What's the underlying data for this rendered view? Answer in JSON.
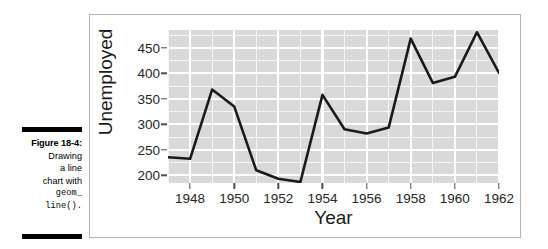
{
  "caption": {
    "figure_label": "Figure 18-4:",
    "lines": [
      "Drawing",
      "a line",
      "chart with"
    ],
    "code_lines": [
      "geom_",
      "line()."
    ]
  },
  "chart_data": {
    "type": "line",
    "title": "",
    "xlabel": "Year",
    "ylabel": "Unemployed",
    "xlim": [
      1947,
      1962
    ],
    "ylim": [
      185,
      485
    ],
    "grid": true,
    "legend": "none",
    "line_color": "#1a1a1a",
    "panel_background": "#d9d9d9",
    "grid_color": "#ffffff",
    "x_ticks": [
      1948,
      1950,
      1952,
      1954,
      1956,
      1958,
      1960,
      1962
    ],
    "x_tick_labels": [
      "1948",
      "1950",
      "1952",
      "1954",
      "1956",
      "1958",
      "1960",
      "1962"
    ],
    "y_ticks": [
      200,
      250,
      300,
      350,
      400,
      450
    ],
    "y_tick_labels": [
      "200",
      "250",
      "300",
      "350",
      "400",
      "450"
    ],
    "x": [
      1947,
      1948,
      1949,
      1950,
      1951,
      1952,
      1953,
      1954,
      1955,
      1956,
      1957,
      1958,
      1959,
      1960,
      1961,
      1962
    ],
    "values": [
      235.6,
      232.5,
      368.2,
      335.1,
      209.9,
      193.2,
      187.0,
      357.8,
      290.4,
      282.2,
      293.6,
      468.1,
      381.3,
      393.1,
      480.6,
      400.7
    ],
    "series": [
      {
        "name": "Unemployed",
        "values": [
          235.6,
          232.5,
          368.2,
          335.1,
          209.9,
          193.2,
          187.0,
          357.8,
          290.4,
          282.2,
          293.6,
          468.1,
          381.3,
          393.1,
          480.6,
          400.7
        ]
      }
    ]
  }
}
